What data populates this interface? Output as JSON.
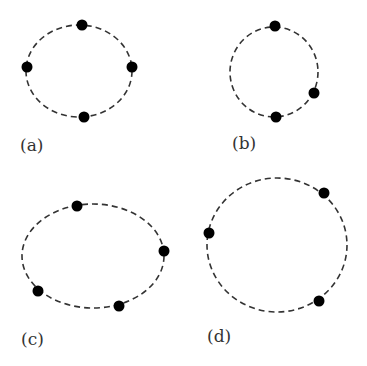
{
  "figure": {
    "panels": [
      {
        "label": "(a)",
        "shape": "ellipse",
        "ellipse": {
          "cx": 79,
          "cy": 71,
          "rx": 53,
          "ry": 46
        },
        "points": [
          {
            "x": 82,
            "y": 25
          },
          {
            "x": 27,
            "y": 67
          },
          {
            "x": 132,
            "y": 67
          },
          {
            "x": 84,
            "y": 117
          }
        ],
        "label_pos": {
          "x": 20,
          "y": 151
        }
      },
      {
        "label": "(b)",
        "shape": "circle",
        "ellipse": {
          "cx": 274,
          "cy": 72,
          "rx": 44,
          "ry": 45
        },
        "points": [
          {
            "x": 275,
            "y": 26
          },
          {
            "x": 314,
            "y": 93
          },
          {
            "x": 276,
            "y": 117
          }
        ],
        "label_pos": {
          "x": 232,
          "y": 149
        }
      },
      {
        "label": "(c)",
        "shape": "ellipse",
        "ellipse": {
          "cx": 93,
          "cy": 256,
          "rx": 71,
          "ry": 52
        },
        "points": [
          {
            "x": 77,
            "y": 206
          },
          {
            "x": 164,
            "y": 251
          },
          {
            "x": 38,
            "y": 291
          },
          {
            "x": 119,
            "y": 306
          }
        ],
        "label_pos": {
          "x": 21,
          "y": 345
        }
      },
      {
        "label": "(d)",
        "shape": "ellipse",
        "ellipse": {
          "cx": 277,
          "cy": 245,
          "rx": 70,
          "ry": 67
        },
        "points": [
          {
            "x": 324,
            "y": 193
          },
          {
            "x": 209,
            "y": 233
          },
          {
            "x": 319,
            "y": 301
          }
        ],
        "label_pos": {
          "x": 207,
          "y": 342
        }
      }
    ],
    "colors": {
      "stroke": "#333333",
      "point": "#000000",
      "background": "#ffffff"
    }
  }
}
